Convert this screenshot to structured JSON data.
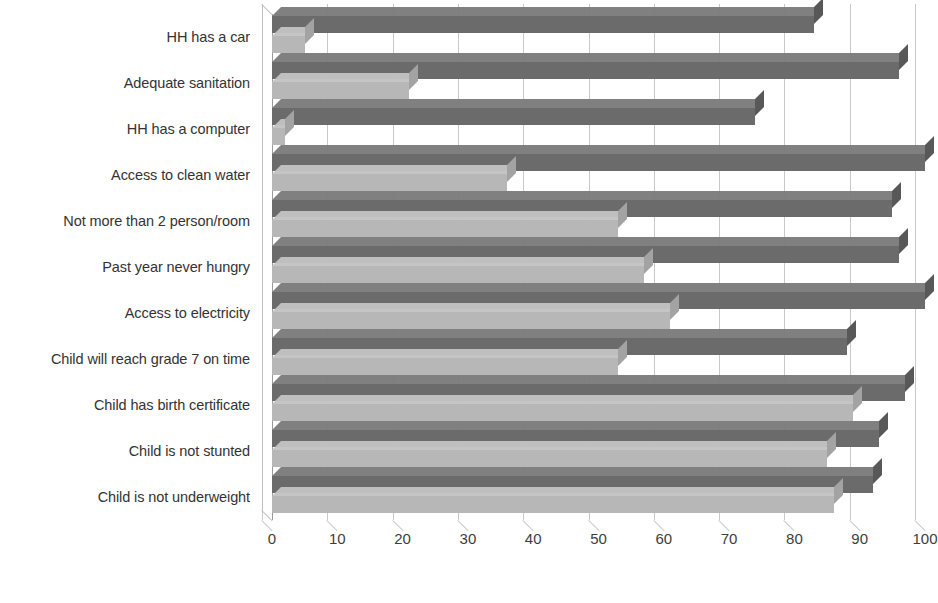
{
  "chart_data": {
    "type": "bar",
    "orientation": "horizontal",
    "title": "",
    "subtitle": "",
    "xlabel": "",
    "ylabel": "",
    "xlim": [
      0,
      100
    ],
    "xticks": [
      0,
      10,
      20,
      30,
      40,
      50,
      60,
      70,
      80,
      90,
      100
    ],
    "xtick_labels": [
      "0",
      "10",
      "20",
      "30",
      "40",
      "50",
      "60",
      "70",
      "80",
      "90",
      "100"
    ],
    "grid": true,
    "legend": false,
    "legend_position": "none",
    "categories": [
      "HH has a car",
      "Adequate sanitation",
      "HH has a computer",
      "Access to clean water",
      "Not more than 2 person/room",
      "Past year never hungry",
      "Access to electricity",
      "Child will reach grade 7 on time",
      "Child has birth certificate",
      "Child is not stunted",
      "Child is not underweight"
    ],
    "series": [
      {
        "name": "series-dark",
        "color": "#6b6b6b",
        "values": [
          83,
          96,
          74,
          100,
          95,
          96,
          100,
          88,
          97,
          93,
          92
        ]
      },
      {
        "name": "series-light",
        "color": "#b7b7b7",
        "values": [
          5,
          21,
          2,
          36,
          53,
          57,
          61,
          53,
          89,
          85,
          86
        ]
      }
    ],
    "colors": {
      "dark_bar": "#6b6b6b",
      "light_bar": "#b7b7b7",
      "gridline": "#c9c9c9",
      "axis": "#9a9a9a",
      "text": "#333333",
      "background": "#ffffff"
    }
  }
}
